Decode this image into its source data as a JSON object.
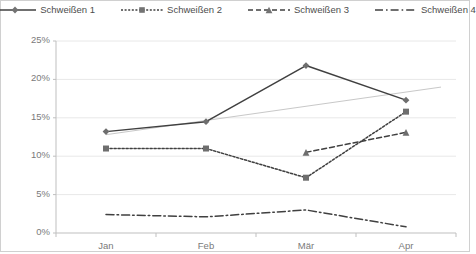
{
  "chart_data": {
    "type": "line",
    "title": "",
    "subtitle": "",
    "xlabel": "",
    "ylabel": "",
    "categories": [
      "Jan",
      "Feb",
      "Mär",
      "Apr"
    ],
    "ylim": [
      0,
      25
    ],
    "yticks": [
      "0%",
      "5%",
      "10%",
      "15%",
      "20%",
      "25%"
    ],
    "ytick_values": [
      0,
      5,
      10,
      15,
      20,
      25
    ],
    "grid": true,
    "legend_position": "top",
    "value_suffix": "%",
    "series": [
      {
        "name": "Schweißen 1",
        "marker": "diamond",
        "line_style": "solid",
        "color": "#404040",
        "values": [
          13.2,
          14.5,
          21.8,
          17.3
        ]
      },
      {
        "name": "Schweißen 2",
        "marker": "square",
        "line_style": "dotted",
        "color": "#404040",
        "values": [
          11.0,
          11.0,
          7.2,
          15.8
        ]
      },
      {
        "name": "Schweißen 3",
        "marker": "triangle",
        "line_style": "dashed",
        "color": "#404040",
        "values": [
          null,
          null,
          10.5,
          13.1
        ]
      },
      {
        "name": "Schweißen 4",
        "marker": "none",
        "line_style": "dashdot",
        "color": "#404040",
        "values": [
          2.4,
          2.1,
          3.0,
          0.8
        ]
      }
    ],
    "trendline": {
      "name": "trendline",
      "color": "#bfbfbf",
      "line_style": "solid",
      "start": 12.8,
      "end": 19.0
    }
  },
  "colors": {
    "axis": "#bfbfbf",
    "grid": "#e8e8e8",
    "series": "#404040",
    "trendline": "#c8c8c8",
    "text": "#7a7a7a",
    "border": "#d0d0d0",
    "background": "#ffffff"
  }
}
